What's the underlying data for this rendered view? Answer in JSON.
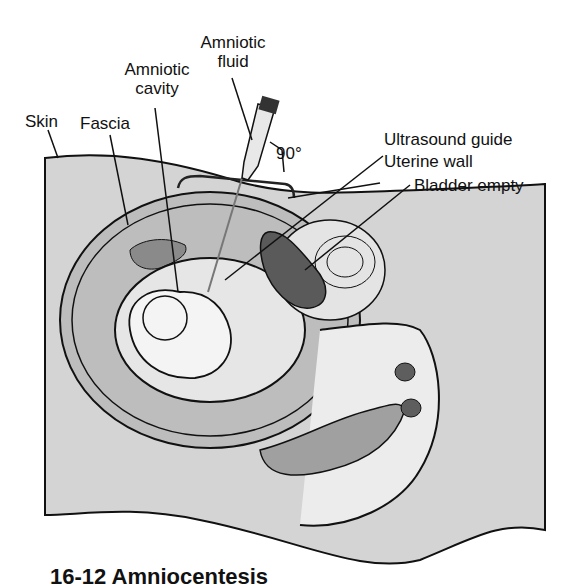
{
  "figure": {
    "title": "Amniocentesis",
    "caption_partial": "16-12  Amniocentesis",
    "labels": {
      "skin": "Skin",
      "fascia": "Fascia",
      "amniotic_cavity_1": "Amniotic",
      "amniotic_cavity_2": "cavity",
      "amniotic_fluid_1": "Amniotic",
      "amniotic_fluid_2": "fluid",
      "angle": "90°",
      "ultrasound_guide": "Ultrasound guide",
      "uterine_wall": "Uterine wall",
      "bladder_empty": "Bladder empty"
    },
    "colors": {
      "body_fill": "#d4d4d4",
      "uterus_fill": "#bdbdbd",
      "fluid_fill": "#e6e6e6",
      "bladder_fill": "#5a5a5a",
      "outline": "#111111"
    }
  }
}
